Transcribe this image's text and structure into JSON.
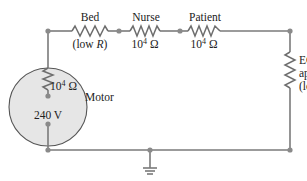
{
  "diagram": {
    "type": "circuit",
    "components": {
      "bed": {
        "name": "Bed",
        "value_prefix": "(low ",
        "value_var": "R",
        "value_suffix": ")"
      },
      "nurse": {
        "name": "Nurse",
        "value_base": "10",
        "value_exp": "4",
        "value_unit": " Ω"
      },
      "patient": {
        "name": "Patient",
        "value_base": "10",
        "value_exp": "4",
        "value_unit": " Ω"
      },
      "ecg": {
        "line1": "ECG",
        "line2": "apparatus",
        "line3_prefix": "(low ",
        "line3_var": "R",
        "line3_suffix": ")"
      },
      "motor": {
        "name": "Motor",
        "resistor_base": "10",
        "resistor_exp": "4",
        "resistor_unit": " Ω",
        "voltage": "240 V"
      },
      "ground": {
        "symbol": "ground"
      }
    },
    "colors": {
      "wire": "#7a7a7a",
      "motor_fill": "#e6e6e6",
      "text": "#222222"
    }
  }
}
